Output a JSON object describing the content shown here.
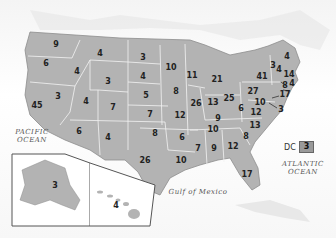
{
  "map": {
    "type": "us-states-values",
    "colors": {
      "land": "#b3b3b3",
      "land_dark": "#a0a0a0",
      "border": "#f2f2f2",
      "water": "#ffffff",
      "label": "#222222"
    },
    "water_labels": {
      "pacific": "PACIFIC\nOCEAN",
      "atlantic": "ATLANTIC\nOCEAN",
      "gulf": "Gulf of Mexico"
    },
    "dc": {
      "label": "DC",
      "value": "3"
    },
    "states": [
      {
        "state": "WA",
        "value": "9",
        "x": 56,
        "y": 45
      },
      {
        "state": "OR",
        "value": "6",
        "x": 46,
        "y": 64
      },
      {
        "state": "CA",
        "value": "45",
        "x": 37,
        "y": 106
      },
      {
        "state": "NV",
        "value": "3",
        "x": 58,
        "y": 97
      },
      {
        "state": "ID",
        "value": "4",
        "x": 77,
        "y": 72
      },
      {
        "state": "MT",
        "value": "4",
        "x": 100,
        "y": 54
      },
      {
        "state": "WY",
        "value": "3",
        "x": 108,
        "y": 82
      },
      {
        "state": "UT",
        "value": "4",
        "x": 86,
        "y": 102
      },
      {
        "state": "CO",
        "value": "7",
        "x": 113,
        "y": 108
      },
      {
        "state": "AZ",
        "value": "6",
        "x": 79,
        "y": 132
      },
      {
        "state": "NM",
        "value": "4",
        "x": 108,
        "y": 138
      },
      {
        "state": "ND",
        "value": "3",
        "x": 143,
        "y": 58
      },
      {
        "state": "SD",
        "value": "4",
        "x": 143,
        "y": 77
      },
      {
        "state": "NE",
        "value": "5",
        "x": 146,
        "y": 96
      },
      {
        "state": "KS",
        "value": "7",
        "x": 150,
        "y": 115
      },
      {
        "state": "OK",
        "value": "8",
        "x": 155,
        "y": 134
      },
      {
        "state": "TX",
        "value": "26",
        "x": 145,
        "y": 161
      },
      {
        "state": "MN",
        "value": "10",
        "x": 171,
        "y": 68
      },
      {
        "state": "IA",
        "value": "8",
        "x": 176,
        "y": 92
      },
      {
        "state": "MO",
        "value": "12",
        "x": 180,
        "y": 116
      },
      {
        "state": "AR",
        "value": "6",
        "x": 182,
        "y": 138
      },
      {
        "state": "LA",
        "value": "10",
        "x": 181,
        "y": 161
      },
      {
        "state": "WI",
        "value": "11",
        "x": 192,
        "y": 76
      },
      {
        "state": "IL",
        "value": "26",
        "x": 196,
        "y": 104
      },
      {
        "state": "MI",
        "value": "21",
        "x": 217,
        "y": 80
      },
      {
        "state": "IN",
        "value": "13",
        "x": 213,
        "y": 103
      },
      {
        "state": "OH",
        "value": "25",
        "x": 229,
        "y": 99
      },
      {
        "state": "KY",
        "value": "9",
        "x": 218,
        "y": 119
      },
      {
        "state": "TN",
        "value": "10",
        "x": 213,
        "y": 130
      },
      {
        "state": "MS",
        "value": "7",
        "x": 198,
        "y": 149
      },
      {
        "state": "AL",
        "value": "9",
        "x": 214,
        "y": 149
      },
      {
        "state": "GA",
        "value": "12",
        "x": 233,
        "y": 147
      },
      {
        "state": "FL",
        "value": "17",
        "x": 247,
        "y": 175
      },
      {
        "state": "SC",
        "value": "8",
        "x": 246,
        "y": 137
      },
      {
        "state": "NC",
        "value": "13",
        "x": 255,
        "y": 126
      },
      {
        "state": "VA",
        "value": "12",
        "x": 256,
        "y": 113
      },
      {
        "state": "WV",
        "value": "6",
        "x": 241,
        "y": 109
      },
      {
        "state": "PA",
        "value": "27",
        "x": 253,
        "y": 92
      },
      {
        "state": "NY",
        "value": "41",
        "x": 262,
        "y": 77
      },
      {
        "state": "MD",
        "value": "10",
        "x": 260,
        "y": 103
      },
      {
        "state": "DE",
        "value": "3",
        "x": 281,
        "y": 110
      },
      {
        "state": "NJ",
        "value": "17",
        "x": 285,
        "y": 95
      },
      {
        "state": "CT",
        "value": "8",
        "x": 285,
        "y": 86
      },
      {
        "state": "RI",
        "value": "4",
        "x": 292,
        "y": 84
      },
      {
        "state": "MA",
        "value": "14",
        "x": 289,
        "y": 75
      },
      {
        "state": "VT",
        "value": "3",
        "x": 273,
        "y": 66
      },
      {
        "state": "NH",
        "value": "4",
        "x": 279,
        "y": 70
      },
      {
        "state": "ME",
        "value": "4",
        "x": 287,
        "y": 57
      },
      {
        "state": "AK",
        "value": "3",
        "x": 55,
        "y": 186
      },
      {
        "state": "HI",
        "value": "4",
        "x": 116,
        "y": 206
      }
    ]
  }
}
